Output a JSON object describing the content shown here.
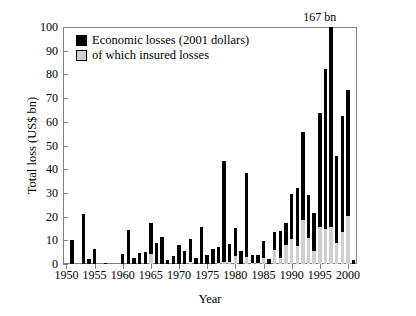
{
  "chart_data": {
    "type": "bar",
    "title": "",
    "subtitle": "",
    "xlabel": "Year",
    "ylabel": "Total loss (US$ bn)",
    "ylim": [
      0,
      100
    ],
    "yticks": [
      0,
      10,
      20,
      30,
      40,
      50,
      60,
      70,
      80,
      90,
      100
    ],
    "xticks": [
      1950,
      1955,
      1960,
      1965,
      1970,
      1975,
      1980,
      1985,
      1990,
      1995,
      2000
    ],
    "xlim": [
      1949.4,
      2001.6
    ],
    "grid": false,
    "stacked": true,
    "legend": {
      "position": "top-left",
      "entries": [
        {
          "label": "Economic losses (2001 dollars)",
          "color": "#000000",
          "key": "economic"
        },
        {
          "label": "of which insured losses",
          "color": "#cfcfcf",
          "key": "insured"
        }
      ]
    },
    "annotations": [
      {
        "text": "167 bn",
        "year": 1995,
        "value": 100,
        "note": "value clipped at axis top"
      }
    ],
    "categories": [
      1950,
      1951,
      1952,
      1953,
      1954,
      1955,
      1956,
      1957,
      1958,
      1959,
      1960,
      1961,
      1962,
      1963,
      1964,
      1965,
      1966,
      1967,
      1968,
      1969,
      1970,
      1971,
      1972,
      1973,
      1974,
      1975,
      1976,
      1977,
      1978,
      1979,
      1980,
      1981,
      1982,
      1983,
      1984,
      1985,
      1986,
      1987,
      1988,
      1989,
      1990,
      1991,
      1992,
      1993,
      1994,
      1995,
      1996,
      1997,
      1998,
      1999,
      2000,
      2001
    ],
    "series": [
      {
        "name": "Economic losses (2001 dollars)",
        "color": "#000000",
        "values": [
          0,
          10.2,
          0,
          21.3,
          2.2,
          6.2,
          0,
          0.4,
          0,
          0,
          4.3,
          14.2,
          2.6,
          4.8,
          5.2,
          17.3,
          9.0,
          11.4,
          1.8,
          3.5,
          8.0,
          5.6,
          10.4,
          2.5,
          15.8,
          4.0,
          6.4,
          7.0,
          43.6,
          8.5,
          15.2,
          5.6,
          38.4,
          3.6,
          4.0,
          9.6,
          2.0,
          13.4,
          13.8,
          17.4,
          29.6,
          32.0,
          55.6,
          29.0,
          21.4,
          63.8,
          82.4,
          100.0,
          45.6,
          62.4,
          73.4,
          1.5
        ]
      },
      {
        "name": "of which insured losses",
        "color": "#cfcfcf",
        "values": [
          0,
          0,
          0,
          0,
          0,
          0,
          0,
          0,
          0,
          0,
          0,
          0,
          0,
          0,
          0,
          4.6,
          0.4,
          0.2,
          0,
          0,
          0.4,
          0.6,
          1.2,
          0.4,
          0.6,
          0.3,
          0.5,
          0.8,
          1.4,
          1.4,
          3.8,
          0.6,
          3.2,
          0.8,
          1.0,
          3.0,
          0.6,
          6.4,
          3.0,
          8.4,
          11.0,
          8.0,
          19.0,
          11.6,
          6.0,
          16.0,
          15.0,
          16.2,
          9.2,
          14.0,
          20.6,
          0.2
        ]
      }
    ]
  }
}
